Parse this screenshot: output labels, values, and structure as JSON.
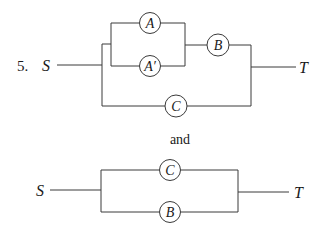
{
  "problem": {
    "number_label": "5.",
    "connector_text": "and"
  },
  "colors": {
    "line": "#3a3a3a",
    "text": "#1a1a1a",
    "background": "#ffffff"
  },
  "circuit_1": {
    "source_label": "S",
    "target_label": "T",
    "components": [
      {
        "id": "A",
        "label": "A",
        "cx": 150,
        "cy": 23,
        "r": 10.5
      },
      {
        "id": "A_prime",
        "label": "A′",
        "cx": 150,
        "cy": 66,
        "r": 10.5
      },
      {
        "id": "B",
        "label": "B",
        "cx": 218,
        "cy": 45,
        "r": 11
      },
      {
        "id": "C",
        "label": "C",
        "cx": 176,
        "cy": 106,
        "r": 11
      }
    ],
    "description": "A and A′ in parallel, in series with B; that combination in parallel with C, between S and T"
  },
  "circuit_2": {
    "source_label": "S",
    "target_label": "T",
    "components": [
      {
        "id": "C",
        "label": "C",
        "cx": 170,
        "cy": 170,
        "r": 10.5
      },
      {
        "id": "B",
        "label": "B",
        "cx": 170,
        "cy": 212,
        "r": 10.5
      }
    ],
    "description": "C and B in parallel between S and T"
  }
}
